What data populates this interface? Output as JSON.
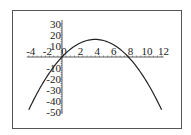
{
  "chart_data": {
    "type": "line",
    "title": "",
    "xlabel": "",
    "ylabel": "",
    "function": "y = -x^2 + 8x",
    "xlim": [
      -4,
      12
    ],
    "ylim": [
      -50,
      30
    ],
    "grid": false,
    "legend": null,
    "x_ticks": [
      "-4",
      "-2",
      "0",
      "2",
      "4",
      "6",
      "8",
      "10",
      "12"
    ],
    "y_ticks": [
      "30",
      "20",
      "10",
      "-10",
      "-20",
      "-30",
      "-40",
      "-50"
    ],
    "series": [
      {
        "name": "curve",
        "x": [
          -4,
          -3,
          -2,
          -1,
          0,
          1,
          2,
          3,
          4,
          5,
          6,
          7,
          8,
          9,
          10,
          11,
          12
        ],
        "y": [
          -48,
          -33,
          -20,
          -9,
          0,
          7,
          12,
          15,
          16,
          15,
          12,
          7,
          0,
          -9,
          -20,
          -33,
          -48
        ]
      }
    ],
    "colors": {
      "curve": "#222222",
      "axes": "#333333",
      "frame": "#555555"
    }
  }
}
